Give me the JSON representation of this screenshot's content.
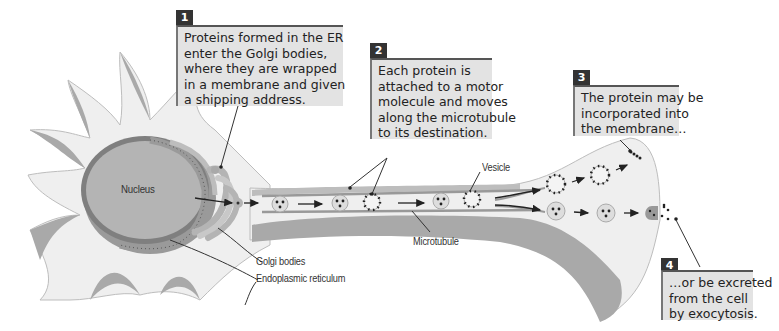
{
  "diagram": {
    "labels": {
      "nucleus": "Nucleus",
      "vesicle": "Vesicle",
      "microtubule": "Microtubule",
      "golgi": "Golgi bodies",
      "er": "Endoplasmic reticulum"
    },
    "callouts": [
      {
        "number": "1",
        "lines": [
          "Proteins formed in the ER",
          "enter the Golgi bodies,",
          "where they are wrapped",
          "in a membrane and given",
          "a shipping address."
        ]
      },
      {
        "number": "2",
        "lines": [
          "Each protein is",
          "attached to a motor",
          "molecule and moves",
          "along the microtubule",
          "to its destination."
        ]
      },
      {
        "number": "3",
        "lines": [
          "The protein may be",
          "incorporated into",
          "the membrane…"
        ]
      },
      {
        "number": "4",
        "lines": [
          "…or be excreted",
          "from the cell",
          "by exocytosis."
        ]
      }
    ],
    "colors": {
      "cytoplasm": "#efefef",
      "membrane_shade": "#a9a9a9",
      "nucleus_fill": "#b4b4b4",
      "nucleus_ring": "#7f7f7f",
      "callout_bg": "#e3e3e3",
      "badge_bg": "#333333"
    }
  }
}
